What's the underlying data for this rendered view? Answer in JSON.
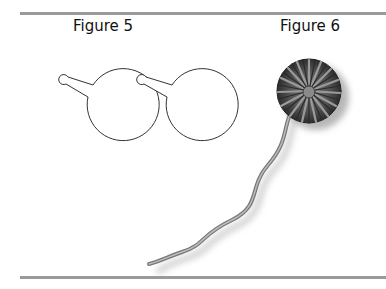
{
  "figures": [
    {
      "label": "Figure 5",
      "content": "two circular discs with a small central hole and a radial slit cut to the edge"
    },
    {
      "label": "Figure 6",
      "content": "a pom-pom-like rosette (gathered, pleated disc) with a long wavy stem"
    }
  ],
  "colors": {
    "rule": "#9a9a9a",
    "outline": "#333333",
    "flower_dark": "#3a3a3a",
    "flower_mid": "#6e6e6e",
    "stem": "#8a8a8a"
  }
}
